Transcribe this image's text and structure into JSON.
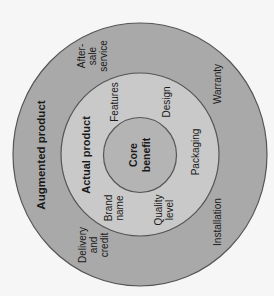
{
  "diagram": {
    "title_note": "Three levels of product (rotated 90° counter-clockwise)",
    "colors": {
      "background": "#f6f6f6",
      "augmented_fill": "#a9a9a9",
      "actual_fill": "#c9c9c9",
      "core_fill": "#b4b4b4",
      "stroke": "#555555",
      "text": "#1a1a1a"
    },
    "levels": {
      "augmented": {
        "label": "Augmented product",
        "items": [
          {
            "lines": [
              "After-",
              "sale",
              "service"
            ]
          },
          {
            "lines": [
              "Warranty"
            ]
          },
          {
            "lines": [
              "Installation"
            ]
          },
          {
            "lines": [
              "Delivery",
              "and",
              "credit"
            ]
          }
        ]
      },
      "actual": {
        "label": "Actual product",
        "items": [
          {
            "lines": [
              "Features"
            ]
          },
          {
            "lines": [
              "Design"
            ]
          },
          {
            "lines": [
              "Packaging"
            ]
          },
          {
            "lines": [
              "Quality",
              "level"
            ]
          },
          {
            "lines": [
              "Brand",
              "name"
            ]
          }
        ]
      },
      "core": {
        "lines": [
          "Core",
          "benefit"
        ]
      }
    }
  }
}
